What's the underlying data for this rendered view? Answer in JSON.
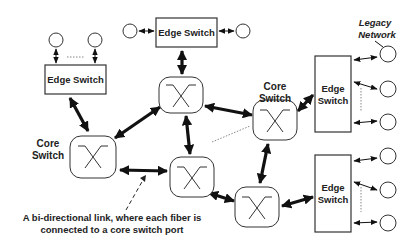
{
  "diagram": {
    "edge_switch_label": "Edge Switch",
    "edge_switch_label_line1": "Edge",
    "edge_switch_label_line2": "Switch",
    "core_switch_label_line1": "Core",
    "core_switch_label_line2": "Switch",
    "legacy_network_line1": "Legacy",
    "legacy_network_line2": "Network",
    "caption_line1": "A bi-directional link, where each fiber is",
    "caption_line2": "connected to a core switch port",
    "nodes": {
      "edge_switches": [
        "edge-top-left",
        "edge-top-center",
        "edge-right-top",
        "edge-right-bottom"
      ],
      "core_switches": [
        "core-top",
        "core-left",
        "core-middle",
        "core-right",
        "core-bottom"
      ],
      "end_hosts": 10
    },
    "links": [
      {
        "from": "edge-top-left",
        "to": "core-left",
        "type": "bi-directional"
      },
      {
        "from": "edge-top-center",
        "to": "core-top",
        "type": "bi-directional"
      },
      {
        "from": "core-top",
        "to": "core-left",
        "type": "bi-directional"
      },
      {
        "from": "core-top",
        "to": "core-right",
        "type": "bi-directional"
      },
      {
        "from": "core-top",
        "to": "core-middle",
        "type": "bi-directional"
      },
      {
        "from": "core-left",
        "to": "core-middle",
        "type": "bi-directional"
      },
      {
        "from": "core-middle",
        "to": "core-bottom",
        "type": "bi-directional"
      },
      {
        "from": "core-right",
        "to": "core-bottom",
        "type": "bi-directional"
      },
      {
        "from": "core-right",
        "to": "edge-right-top",
        "type": "bi-directional"
      },
      {
        "from": "core-bottom",
        "to": "edge-right-bottom",
        "type": "bi-directional"
      }
    ]
  }
}
